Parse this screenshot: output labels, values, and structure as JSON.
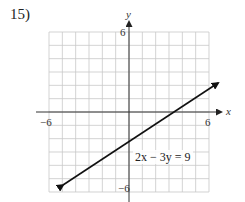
{
  "problem": {
    "number_label": "15)"
  },
  "graph": {
    "x_axis_label": "x",
    "y_axis_label": "y",
    "tick_labels": {
      "x_min": "−6",
      "x_max": "6",
      "y_max": "6",
      "y_min": "−6"
    },
    "equation_label": "2x − 3y = 9"
  },
  "chart_data": {
    "type": "line",
    "title": "",
    "xlabel": "x",
    "ylabel": "y",
    "xlim": [
      -6,
      6
    ],
    "ylim": [
      -6,
      6
    ],
    "grid": true,
    "grid_step": 1,
    "series": [
      {
        "name": "2x − 3y = 9",
        "equation": "2x - 3y = 9",
        "slope": 0.6667,
        "y_intercept": -3,
        "x_intercept": 4.5,
        "points": [
          [
            -6,
            -7
          ],
          [
            0,
            -3
          ],
          [
            4.5,
            0
          ],
          [
            6,
            1
          ]
        ],
        "arrows_both_ends": true
      }
    ],
    "annotations": [
      {
        "text": "2x − 3y = 9",
        "near": [
          1,
          -3.5
        ]
      }
    ]
  }
}
